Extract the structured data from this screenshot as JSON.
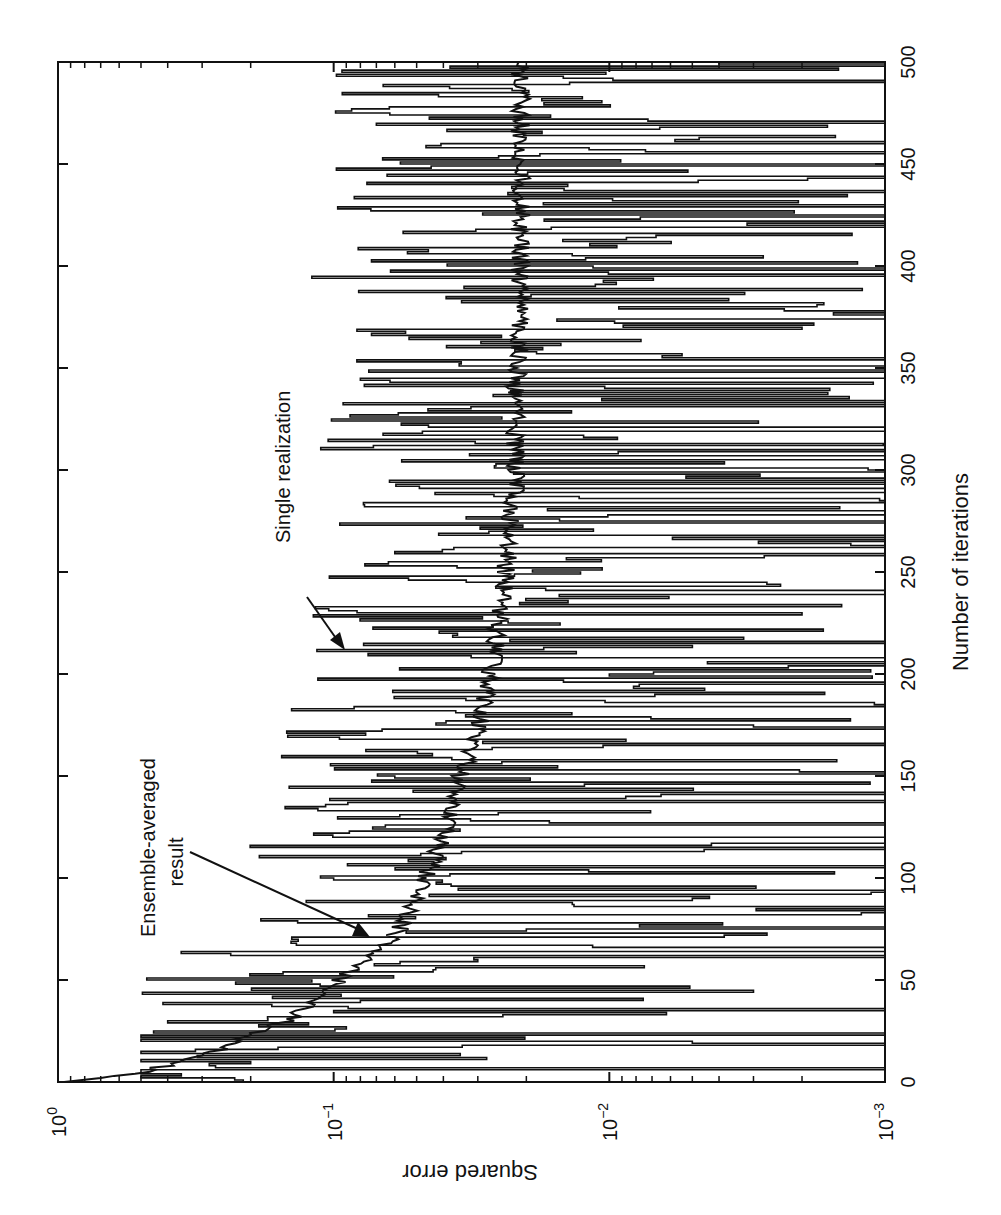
{
  "chart_data": {
    "type": "line",
    "orientation_note": "figure rotated 90 degrees counter-clockwise on page",
    "title": "",
    "xlabel": "Number of iterations",
    "ylabel": "Squared error",
    "xlim": [
      0,
      500
    ],
    "ylim": [
      0.001,
      1
    ],
    "yscale": "log",
    "grid": false,
    "x_ticks": [
      0,
      50,
      100,
      150,
      200,
      250,
      300,
      350,
      400,
      450,
      500
    ],
    "x_tick_labels": [
      "0",
      "50",
      "100",
      "150",
      "200",
      "250",
      "300",
      "350",
      "400",
      "450",
      "500"
    ],
    "y_ticks": [
      1,
      0.1,
      0.01,
      0.001
    ],
    "y_tick_labels": [
      {
        "base": "10",
        "exp": "0"
      },
      {
        "base": "10",
        "exp": "−1"
      },
      {
        "base": "10",
        "exp": "−2"
      },
      {
        "base": "10",
        "exp": "−3"
      }
    ],
    "annotations": [
      {
        "text_lines": [
          "Single realization"
        ],
        "points_to": {
          "x": 210,
          "y": 0.075
        }
      },
      {
        "text_lines": [
          "Ensemble-averaged",
          "result"
        ],
        "points_to": {
          "x": 68,
          "y": 0.068
        }
      }
    ],
    "series": [
      {
        "name": "Ensemble-averaged result",
        "style": "smooth",
        "x": [
          0,
          2,
          5,
          8,
          10,
          13,
          16,
          20,
          25,
          30,
          35,
          40,
          45,
          50,
          55,
          60,
          65,
          70,
          75,
          80,
          90,
          100,
          110,
          120,
          130,
          140,
          150,
          160,
          170,
          180,
          190,
          200,
          210,
          220,
          230,
          240,
          250,
          260,
          270,
          280,
          290,
          300,
          320,
          340,
          360,
          380,
          400,
          420,
          440,
          460,
          480,
          500
        ],
        "values": [
          0.95,
          0.7,
          0.5,
          0.4,
          0.36,
          0.3,
          0.26,
          0.22,
          0.19,
          0.15,
          0.13,
          0.115,
          0.105,
          0.095,
          0.085,
          0.075,
          0.068,
          0.062,
          0.058,
          0.055,
          0.05,
          0.047,
          0.043,
          0.04,
          0.037,
          0.036,
          0.035,
          0.032,
          0.03,
          0.029,
          0.028,
          0.027,
          0.026,
          0.026,
          0.025,
          0.024,
          0.024,
          0.023,
          0.023,
          0.023,
          0.022,
          0.022,
          0.022,
          0.022,
          0.021,
          0.021,
          0.021,
          0.021,
          0.021,
          0.021,
          0.021,
          0.021
        ]
      },
      {
        "name": "Single realization",
        "style": "noisy",
        "description": "highly fluctuating trace spanning roughly 1e-3 to 0.5, tracking the ensemble average from above and below",
        "sample_x": [
          0,
          10,
          20,
          25,
          30,
          35,
          40,
          45,
          50,
          60,
          65,
          75,
          90,
          100,
          120,
          135,
          150,
          175,
          200,
          210,
          230,
          260,
          300,
          345,
          370,
          395,
          430,
          470,
          500
        ],
        "sample_values": [
          0.1,
          0.2,
          0.005,
          0.45,
          0.4,
          0.1,
          0.08,
          0.003,
          0.12,
          0.03,
          0.001,
          0.02,
          0.005,
          0.1,
          0.001,
          0.15,
          0.06,
          0.003,
          0.01,
          0.075,
          0.002,
          0.06,
          0.001,
          0.08,
          0.002,
          0.12,
          0.001,
          0.07,
          0.004
        ]
      }
    ]
  }
}
